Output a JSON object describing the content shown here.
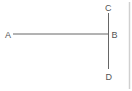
{
  "diagram": {
    "points": [
      {
        "id": "A",
        "label": "A",
        "x": 8,
        "y": 34
      },
      {
        "id": "B",
        "label": "B",
        "x": 115,
        "y": 34
      },
      {
        "id": "C",
        "label": "C",
        "x": 108,
        "y": 8
      },
      {
        "id": "D",
        "label": "D",
        "x": 109,
        "y": 76
      }
    ],
    "segments": [
      {
        "from": "A",
        "to": "B",
        "description": "horizontal segment AB"
      },
      {
        "from": "C",
        "to": "D",
        "description": "vertical segment CD through B"
      }
    ],
    "colors": {
      "line": "#666666",
      "label": "#555555",
      "border": "#d0d0d0"
    }
  }
}
